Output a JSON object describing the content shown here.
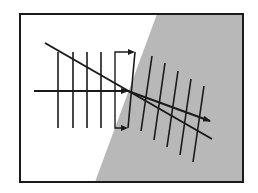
{
  "diagram": {
    "title": "",
    "colors": {
      "background": "#ffffff",
      "medium2_fill": "#b8b8b8",
      "stroke": "#1a1a1a"
    },
    "frame": {
      "x1": 20,
      "y1": 14,
      "x2": 243,
      "y2": 182
    },
    "medium2_polygon": [
      [
        157,
        14
      ],
      [
        243,
        14
      ],
      [
        243,
        182
      ],
      [
        95,
        182
      ]
    ],
    "incident_ray": {
      "x1": 34,
      "y1": 91,
      "x2": 128,
      "y2": 91
    },
    "refracted_ray": {
      "x1": 128,
      "y1": 91,
      "x2": 210,
      "y2": 121
    },
    "normal_line": {
      "x1": 45,
      "y1": 43,
      "x2": 212,
      "y2": 139
    },
    "incident_wavefronts": [
      {
        "x1": 58,
        "y1": 52,
        "x2": 58,
        "y2": 128
      },
      {
        "x1": 73,
        "y1": 52,
        "x2": 73,
        "y2": 128
      },
      {
        "x1": 87,
        "y1": 52,
        "x2": 87,
        "y2": 128
      },
      {
        "x1": 101,
        "y1": 52,
        "x2": 101,
        "y2": 128
      }
    ],
    "bracket": {
      "left_x": 115,
      "top_y": 52,
      "bottom_y": 128,
      "top_arrow_end_x": 135,
      "bottom_arrow_end_x": 128
    },
    "transition_wavefront": {
      "x1": 135,
      "y1": 52,
      "x2": 128,
      "y2": 128
    },
    "refracted_wavefronts": [
      {
        "x1": 152,
        "y1": 56,
        "x2": 141,
        "y2": 131
      },
      {
        "x1": 165,
        "y1": 63,
        "x2": 154,
        "y2": 140
      },
      {
        "x1": 178,
        "y1": 71,
        "x2": 167,
        "y2": 147
      },
      {
        "x1": 191,
        "y1": 79,
        "x2": 180,
        "y2": 155
      },
      {
        "x1": 204,
        "y1": 86,
        "x2": 193,
        "y2": 162
      }
    ]
  }
}
